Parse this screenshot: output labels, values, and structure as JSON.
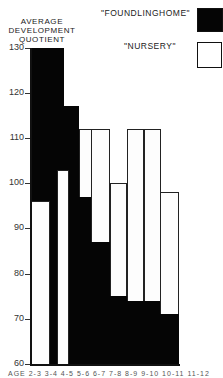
{
  "chart_data": {
    "type": "bar",
    "title": "",
    "ylabel": "AVERAGE DEVELOPMENT QUOTIENT",
    "xlabel": "AGE",
    "ylim": [
      60,
      130
    ],
    "yticks": [
      130,
      120,
      110,
      100,
      90,
      80,
      70,
      60
    ],
    "grid": false,
    "legend_position": "top-right",
    "categories": [
      "1",
      "2",
      "3",
      "4",
      "5",
      "6",
      "7",
      "8"
    ],
    "x_tick_text_partial": "AGE 2-3 3-4 4-5 5-6 6-7 7-8 8-9 ...",
    "series": [
      {
        "name": "\"FOUNDLINGHOME\"",
        "color": "#000000",
        "values": [
          130,
          117,
          97,
          87,
          75,
          74,
          74,
          71
        ]
      },
      {
        "name": "\"NURSERY\"",
        "color": "#ffffff",
        "values": [
          96,
          103,
          112,
          112,
          100,
          112,
          112,
          98
        ]
      }
    ]
  },
  "labels": {
    "ylabel_line1": "AVERAGE",
    "ylabel_line2": "DEVELOPMENT",
    "ylabel_line3": "QUOTIENT",
    "legend_found": "\"FOUNDLINGHOME\"",
    "legend_nurs": "\"NURSERY\"",
    "xaxis_text": "AGE 2-3  3-4 4-5  5-6 6-7 7-8 8-9 9-10 10-11 11-12"
  }
}
